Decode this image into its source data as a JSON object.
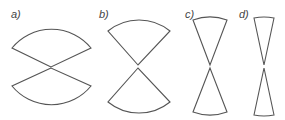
{
  "labels": [
    "a)",
    "b)",
    "c)",
    "d)"
  ],
  "figure": {
    "stroke_color": "#555555",
    "panels": [
      {
        "label": "a)",
        "opening": "wide"
      },
      {
        "label": "b)",
        "opening": "medium"
      },
      {
        "label": "c)",
        "opening": "narrow"
      },
      {
        "label": "d)",
        "opening": "very narrow"
      }
    ]
  }
}
